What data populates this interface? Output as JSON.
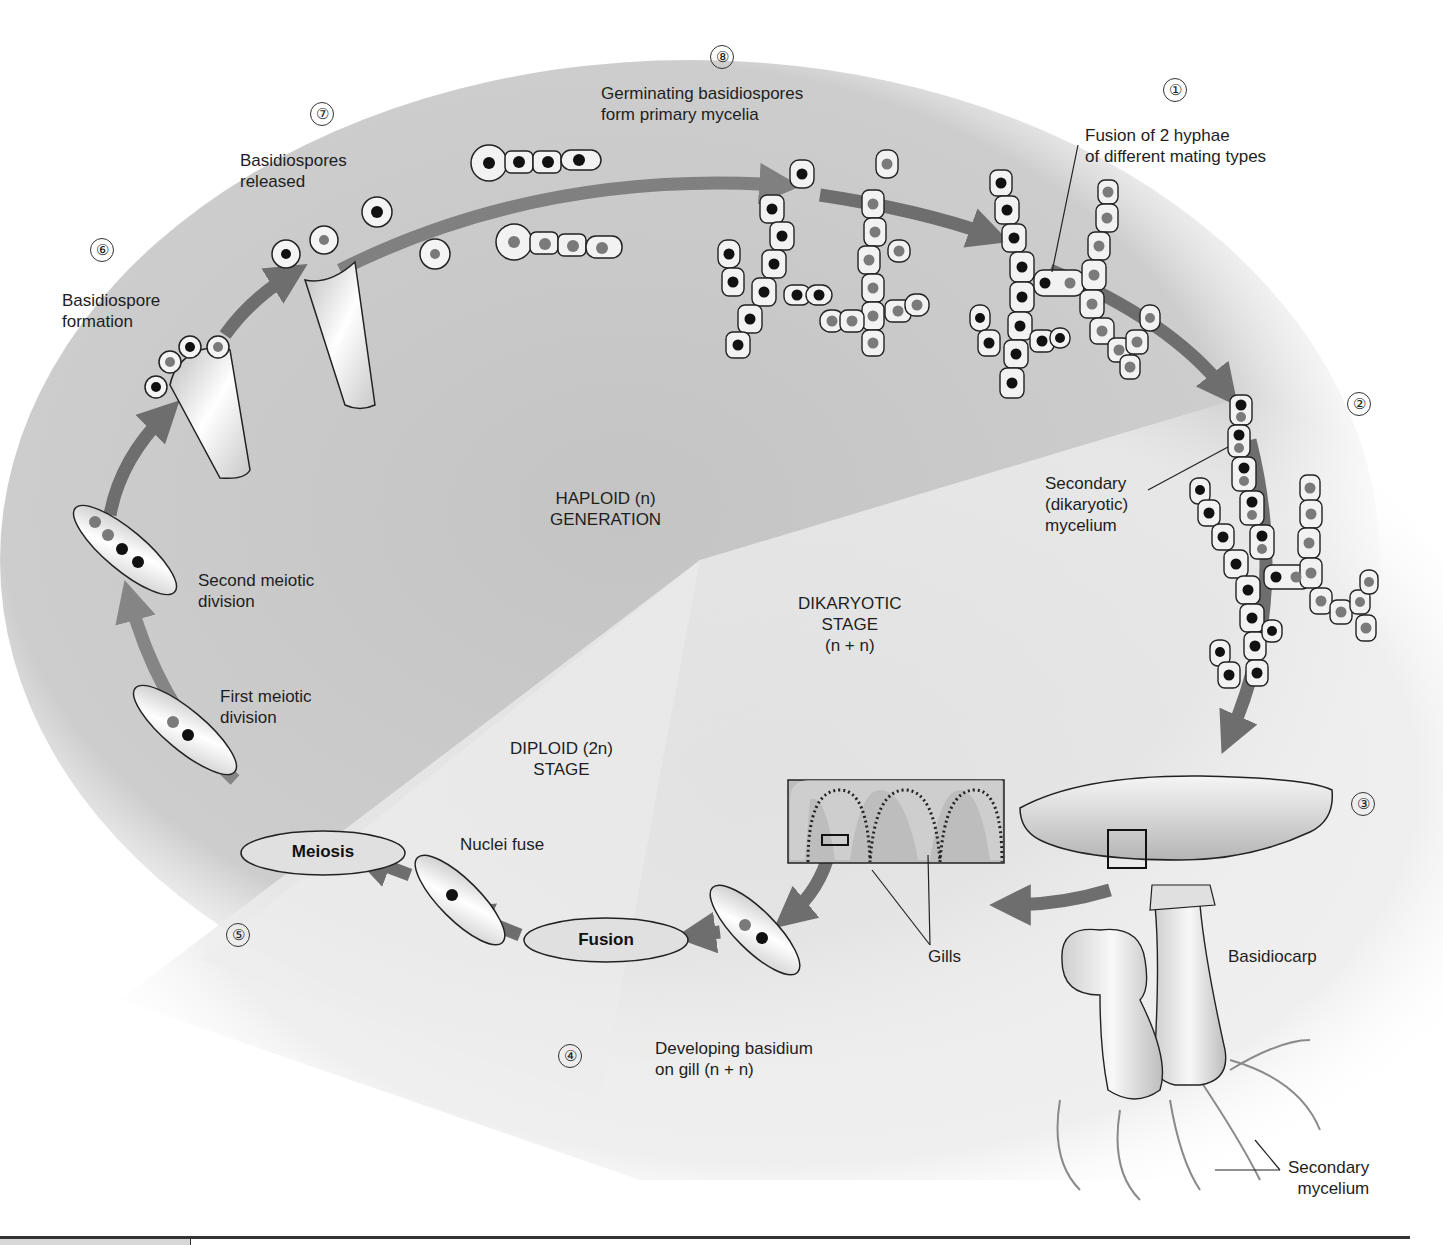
{
  "figure": {
    "stage_numbers": [
      "①",
      "②",
      "③",
      "④",
      "⑤",
      "⑥",
      "⑦",
      "⑧"
    ],
    "steps": [
      {
        "number": "①",
        "label": "Fusion of 2 hyphae\nof different mating types"
      },
      {
        "number": "②",
        "label": "Secondary\n(dikaryotic)\nmycelium"
      },
      {
        "number": "③",
        "label": "Basidiocarp"
      },
      {
        "number": "④",
        "label": "Developing basidium\non gill (n + n)"
      },
      {
        "number": "⑤",
        "label": "Meiosis"
      },
      {
        "number": "⑥",
        "label": "Basidiospore\nformation"
      },
      {
        "number": "⑦",
        "label": "Basidiospores\nreleased"
      },
      {
        "number": "⑧",
        "label": "Germinating basidiospores\nform primary mycelia"
      }
    ],
    "regions": {
      "haploid": "HAPLOID (n)\nGENERATION",
      "dikaryotic": "DIKARYOTIC\nSTAGE\n(n + n)",
      "diploid": "DIPLOID (2n)\nSTAGE"
    },
    "annotations": {
      "second_meiotic": "Second meiotic\ndivision",
      "first_meiotic": "First meiotic\ndivision",
      "nuclei_fuse": "Nuclei fuse",
      "fusion": "Fusion",
      "meiosis": "Meiosis",
      "gills": "Gills",
      "basidiocarp": "Basidiocarp",
      "secondary_mycelium": "Secondary\nmycelium"
    },
    "colors": {
      "haploid_bg": "#c9c9c9",
      "dikaryotic_bg": "#e4e4e4",
      "arrow": "#6e6e6e",
      "nucleus_dark": "#111111",
      "nucleus_gray": "#7a7a7a",
      "cell_fill": "#f2f2f2"
    }
  }
}
